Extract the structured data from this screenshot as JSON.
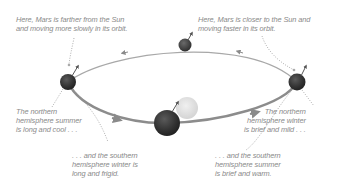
{
  "diagram": {
    "colors": {
      "orbit": "#9a9a9a",
      "sun": "#e2e2e2",
      "planet_dark": "#2e2e2e",
      "planet_mid": "#4a4a4a",
      "text": "#8a8a8a",
      "leader": "#9a9a9a"
    },
    "objects": {
      "sun": {
        "name": "Sun",
        "cx": 187,
        "cy": 108,
        "r": 11
      },
      "mars_positions": [
        {
          "id": "left",
          "cx": 68,
          "cy": 82,
          "r": 8
        },
        {
          "id": "top",
          "cx": 185,
          "cy": 45,
          "r": 6.5
        },
        {
          "id": "right",
          "cx": 297,
          "cy": 82,
          "r": 8.5
        },
        {
          "id": "bottom",
          "cx": 167,
          "cy": 122,
          "r": 13
        }
      ]
    },
    "labels": {
      "aphelion_note": {
        "lines": [
          "Here, Mars is farther from the Sun",
          "and moving more slowly in its orbit."
        ]
      },
      "perihelion_note": {
        "lines": [
          "Here, Mars is closer to the Sun and",
          "moving faster in its orbit."
        ]
      },
      "north_summer": {
        "lines": [
          "The northern",
          "hemisphere summer",
          "is long and cool . . ."
        ]
      },
      "south_winter": {
        "lines": [
          ". . . and the southern",
          "hemisphere winter is",
          "long and frigid."
        ]
      },
      "north_winter": {
        "lines": [
          "The northern",
          "hemisphere winter",
          "is brief and mild . . ."
        ]
      },
      "south_summer": {
        "lines": [
          ". . . and the southern",
          "hemisphere summer",
          "is brief and warm."
        ]
      }
    }
  }
}
